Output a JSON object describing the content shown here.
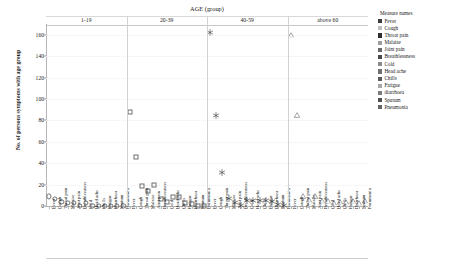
{
  "chart_data": {
    "type": "scatter",
    "title": "AGE (group)",
    "xlabel": "",
    "ylabel": "No. of persons symptoms with age group",
    "ylim": [
      0,
      170
    ],
    "yticks": [
      0,
      20,
      40,
      60,
      80,
      100,
      120,
      140,
      160
    ],
    "grid": true,
    "legend_position": "right",
    "legend_title": "Measure names",
    "categories": [
      "Fever",
      "Cough",
      "Throat pain",
      "Malaise",
      "Joint pain",
      "Breathlessness",
      "Cold",
      "Head ache",
      "Chills",
      "Fatigue",
      "Diarrhoea",
      "Sputum",
      "Pneumonia"
    ],
    "panels": [
      {
        "label": "1-19",
        "marker": "circle",
        "values": [
          9,
          7,
          4,
          3,
          3,
          0,
          3,
          0,
          0,
          0,
          0,
          0,
          0
        ]
      },
      {
        "label": "20-39",
        "marker": "square",
        "values": [
          88,
          46,
          19,
          14,
          20,
          7,
          4,
          8,
          8,
          3,
          2,
          0,
          0
        ]
      },
      {
        "label": "40-59",
        "marker": "asterisk",
        "values": [
          163,
          86,
          33,
          8,
          5,
          2,
          7,
          7,
          7,
          7,
          6,
          3,
          2
        ]
      },
      {
        "label": "above 60",
        "marker": "triangle",
        "values": [
          160,
          85,
          9,
          6,
          9,
          5,
          5,
          3,
          4,
          4,
          5,
          3,
          5
        ]
      }
    ]
  },
  "legend": {
    "title": "Measure names",
    "items": [
      {
        "label": "Fever",
        "color": "#3c3c3c"
      },
      {
        "label": "Cough",
        "color": "#bdbdbd"
      },
      {
        "label": "Throat pain",
        "color": "#2f2f2f"
      },
      {
        "label": "Malaise",
        "color": "#9d9d9d"
      },
      {
        "label": "Joint pain",
        "color": "#6a6a6a"
      },
      {
        "label": "Breathlessness",
        "color": "#4a4a4a"
      },
      {
        "label": "Cold",
        "color": "#8a8a8a"
      },
      {
        "label": "Head ache",
        "color": "#707070"
      },
      {
        "label": "Chills",
        "color": "#5a5a5a"
      },
      {
        "label": "Fatigue",
        "color": "#a8a8a8"
      },
      {
        "label": "diarrhoea",
        "color": "#7c7c7c"
      },
      {
        "label": "Sputum",
        "color": "#4f4f4f"
      },
      {
        "label": "Pneumonia",
        "color": "#666666"
      }
    ]
  },
  "axes": {
    "y_title": "No. of persons symptoms with age group",
    "top_title": "AGE (group)"
  }
}
